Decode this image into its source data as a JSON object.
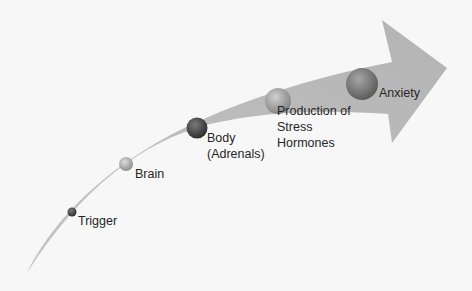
{
  "diagram": {
    "type": "curved-arrow-process",
    "colors": {
      "background": "#f7f7f7",
      "arrow_fill": "#bdbdbd",
      "text": "#262626"
    },
    "steps": [
      {
        "label": "Trigger",
        "node_shade": "#3a3a3a",
        "node_radius": 4
      },
      {
        "label": "Brain",
        "node_shade": "#a8a8a8",
        "node_radius": 7
      },
      {
        "label": "Body\n(Adrenals)",
        "node_shade": "#4a4a4a",
        "node_radius": 10
      },
      {
        "label": "Production of\nStress\nHormones",
        "node_shade": "#9a9a9a",
        "node_radius": 13
      },
      {
        "label": "Anxiety",
        "node_shade": "#7a7a7a",
        "node_radius": 16
      }
    ]
  }
}
